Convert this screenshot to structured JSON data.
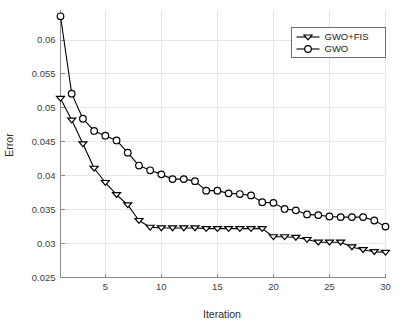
{
  "chart_data": {
    "type": "line",
    "title": "",
    "xlabel": "Iteration",
    "ylabel": "Error",
    "xlim": [
      1,
      30
    ],
    "ylim": [
      0.025,
      0.0645
    ],
    "grid": true,
    "legend_position": "top-right",
    "x": [
      1,
      2,
      3,
      4,
      5,
      6,
      7,
      8,
      9,
      10,
      11,
      12,
      13,
      14,
      15,
      16,
      17,
      18,
      19,
      20,
      21,
      22,
      23,
      24,
      25,
      26,
      27,
      28,
      29,
      30
    ],
    "xticks": [
      "5",
      "10",
      "15",
      "20",
      "25",
      "30"
    ],
    "xtick_values": [
      5,
      10,
      15,
      20,
      25,
      30
    ],
    "yticks": [
      "0.025",
      "0.03",
      "0.035",
      "0.04",
      "0.045",
      "0.05",
      "0.055",
      "0.06"
    ],
    "ytick_values": [
      0.025,
      0.03,
      0.035,
      0.04,
      0.045,
      0.05,
      0.055,
      0.06
    ],
    "series": [
      {
        "name": "GWO+FIS",
        "marker": "triangle-down",
        "color": "#000000",
        "values": [
          0.0514,
          0.0482,
          0.0447,
          0.0411,
          0.039,
          0.0372,
          0.0357,
          0.0334,
          0.0324,
          0.0323,
          0.0323,
          0.0323,
          0.0323,
          0.0322,
          0.0322,
          0.0322,
          0.0322,
          0.0322,
          0.0322,
          0.031,
          0.031,
          0.0309,
          0.0306,
          0.0302,
          0.0302,
          0.0302,
          0.0295,
          0.0291,
          0.0288,
          0.0287
        ]
      },
      {
        "name": "GWO",
        "marker": "circle",
        "color": "#000000",
        "values": [
          0.0635,
          0.0521,
          0.0484,
          0.0466,
          0.0459,
          0.0452,
          0.0434,
          0.0415,
          0.0408,
          0.0402,
          0.0395,
          0.0395,
          0.0392,
          0.0378,
          0.0378,
          0.0374,
          0.0373,
          0.0371,
          0.0361,
          0.036,
          0.0351,
          0.0349,
          0.0343,
          0.0342,
          0.034,
          0.0339,
          0.0339,
          0.0339,
          0.0334,
          0.0325
        ]
      }
    ]
  },
  "legend": {
    "entries": [
      {
        "label": "GWO+FIS"
      },
      {
        "label": "GWO"
      }
    ]
  }
}
